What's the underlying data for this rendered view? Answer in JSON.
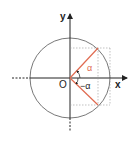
{
  "diagram": {
    "type": "unit-circle",
    "labels": {
      "y_axis": "y",
      "x_axis": "x",
      "origin": "O",
      "angle_positive": "α",
      "angle_negative": "−α"
    },
    "colors": {
      "axis": "#222222",
      "circle": "#555555",
      "ray": "#e06a50",
      "angle_label": "#e06a50",
      "dotted": "#999999"
    }
  }
}
